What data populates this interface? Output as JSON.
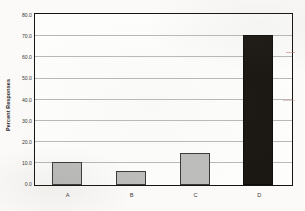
{
  "chart_data": {
    "type": "bar",
    "title": "",
    "xlabel": "",
    "ylabel": "Percent Responses",
    "categories": [
      "A",
      "B",
      "C",
      "D"
    ],
    "values": [
      10.7,
      6.8,
      15.0,
      70.8
    ],
    "ylim": [
      0.0,
      80.0
    ],
    "ytick_step": 10.0,
    "ytick_labels": [
      "80.0",
      "70.0",
      "60.0",
      "50.0",
      "40.0",
      "30.0",
      "20.0",
      "10.0",
      "0.0"
    ],
    "ytick_values": [
      80.0,
      70.0,
      60.0,
      50.0,
      40.0,
      30.0,
      20.0,
      10.0,
      0.0
    ],
    "grid": true,
    "legend": false,
    "legend_position": "none",
    "bar_colors": [
      "#bdbdbb",
      "#bdbdbb",
      "#bdbdbb",
      "#1b1713"
    ],
    "bar_edge_color": "#3a3a38",
    "gridline_color": "#b9b9b5",
    "axis_color": "#15140f",
    "plot_background": "#fdfdfb",
    "figure_background": "#fbfaf8"
  }
}
